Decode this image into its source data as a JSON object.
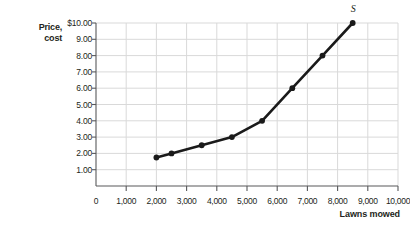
{
  "chart_data": {
    "type": "line",
    "title": "",
    "xlabel": "Lawns mowed",
    "ylabel_line1": "Price,",
    "ylabel_line2": "cost",
    "series_label": "S",
    "x": [
      2000,
      2500,
      3500,
      4500,
      5500,
      6500,
      7500,
      8500
    ],
    "values": [
      1.75,
      2.0,
      2.5,
      3.0,
      4.0,
      6.0,
      8.0,
      10.0
    ],
    "series": [
      {
        "name": "S",
        "points": [
          {
            "x": 2000,
            "y": 1.75
          },
          {
            "x": 2500,
            "y": 2.0
          },
          {
            "x": 3500,
            "y": 2.5
          },
          {
            "x": 4500,
            "y": 3.0
          },
          {
            "x": 5500,
            "y": 4.0
          },
          {
            "x": 6500,
            "y": 6.0
          },
          {
            "x": 7500,
            "y": 8.0
          },
          {
            "x": 8500,
            "y": 10.0
          }
        ]
      }
    ],
    "xlim": [
      0,
      10000
    ],
    "ylim": [
      0,
      10
    ],
    "x_ticks": [
      0,
      1000,
      2000,
      3000,
      4000,
      5000,
      6000,
      7000,
      8000,
      9000,
      10000
    ],
    "x_tick_labels": [
      "0",
      "1,000",
      "2,000",
      "3,000",
      "4,000",
      "5,000",
      "6,000",
      "7,000",
      "8,000",
      "9,000",
      "10,000"
    ],
    "y_ticks": [
      1,
      2,
      3,
      4,
      5,
      6,
      7,
      8,
      9,
      10
    ],
    "y_tick_labels": [
      "1.00",
      "2.00",
      "3.00",
      "4.00",
      "5.00",
      "6.00",
      "7.00",
      "8.00",
      "9.00",
      "$10.00"
    ],
    "grid": true,
    "legend_position": "none",
    "colors": {
      "curve": "#1a1a1a",
      "grid": "#d9d9d9",
      "axis": "#58595b",
      "text": "#231f20"
    }
  }
}
